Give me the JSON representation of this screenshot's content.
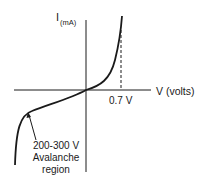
{
  "diagram": {
    "type": "diode I-V characteristic curve",
    "y_axis": {
      "label": "I",
      "unit_subscript": "(mA)"
    },
    "x_axis": {
      "label": "V (volts)"
    },
    "annotations": {
      "forward_voltage": "0.7 V",
      "breakdown_line1": "200-300 V",
      "breakdown_line2": "Avalanche",
      "breakdown_line3": "region"
    },
    "colors": {
      "ink": "#1a1a1a",
      "background": "#ffffff"
    }
  }
}
